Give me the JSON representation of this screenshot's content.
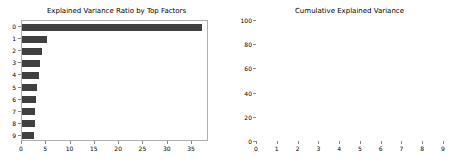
{
  "figure": {
    "background": "#ffffff",
    "bar_color": "#404040",
    "line_color": "#555555",
    "axis_color": "#b0b0b0"
  },
  "chart_data": [
    {
      "type": "bar",
      "orientation": "horizontal",
      "title": "Explained Variance Ratio by Top Factors",
      "xlabel": "",
      "ylabel": "",
      "categories": [
        "0",
        "1",
        "2",
        "3",
        "4",
        "5",
        "6",
        "7",
        "8",
        "9"
      ],
      "values": [
        37.0,
        5.2,
        4.2,
        3.8,
        3.4,
        3.0,
        2.8,
        2.6,
        2.7,
        2.4
      ],
      "xlim": [
        0,
        38.5
      ],
      "ylim_categories_order": "top-to-bottom",
      "xticks": [
        0,
        5,
        10,
        15,
        20,
        25,
        30,
        35
      ],
      "xticklabels": [
        "0",
        "5",
        "10",
        "15",
        "20",
        "25",
        "30",
        "35"
      ],
      "yticks": [
        0,
        1,
        2,
        3,
        4,
        5,
        6,
        7,
        8,
        9
      ],
      "yticklabels": [
        "0",
        "1",
        "2",
        "3",
        "4",
        "5",
        "6",
        "7",
        "8",
        "9"
      ],
      "grid": false,
      "legend": false,
      "bar_color": "#404040"
    },
    {
      "type": "line",
      "title": "Cumulative Explained Variance",
      "xlabel": "",
      "ylabel": "",
      "x": [
        0,
        1,
        2,
        3,
        4,
        5,
        6,
        7,
        8,
        9
      ],
      "values": [
        37.5,
        42.7,
        46.9,
        50.7,
        54.1,
        57.1,
        59.9,
        62.5,
        65.2,
        67.6
      ],
      "xlim": [
        0,
        9
      ],
      "ylim": [
        0,
        100
      ],
      "xticks": [
        0,
        1,
        2,
        3,
        4,
        5,
        6,
        7,
        8,
        9
      ],
      "xticklabels": [
        "0",
        "1",
        "2",
        "3",
        "4",
        "5",
        "6",
        "7",
        "8",
        "9"
      ],
      "yticks": [
        0,
        20,
        40,
        60,
        80,
        100
      ],
      "yticklabels": [
        "0",
        "20",
        "40",
        "60",
        "80",
        "100"
      ],
      "grid": false,
      "legend": false,
      "line_color": "#555555"
    }
  ]
}
